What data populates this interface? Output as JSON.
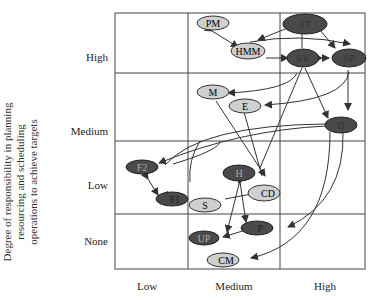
{
  "y_axis": {
    "label_lines": [
      "Degree of responsibility in planning",
      "resourcing and scheduling",
      "operations to achieve targets"
    ],
    "ticks": [
      "High",
      "Medium",
      "Low",
      "None"
    ]
  },
  "x_axis": {
    "ticks": [
      "Low",
      "Medium",
      "High"
    ]
  },
  "nodes": [
    {
      "id": "PM",
      "label": "PM",
      "shade": "light"
    },
    {
      "id": "HMM",
      "label": "HMM",
      "shade": "light"
    },
    {
      "id": "ST",
      "label": "ST",
      "shade": "dark"
    },
    {
      "id": "SV",
      "label": "SV",
      "shade": "dark"
    },
    {
      "id": "SP",
      "label": "SP",
      "shade": "dark"
    },
    {
      "id": "M",
      "label": "M",
      "shade": "light"
    },
    {
      "id": "E",
      "label": "E",
      "shade": "light"
    },
    {
      "id": "D",
      "label": "D",
      "shade": "dark"
    },
    {
      "id": "F2",
      "label": "F2",
      "shade": "dark"
    },
    {
      "id": "F1",
      "label": "F1",
      "shade": "dark"
    },
    {
      "id": "H",
      "label": "H",
      "shade": "dark"
    },
    {
      "id": "CD",
      "label": "CD",
      "shade": "light"
    },
    {
      "id": "S",
      "label": "S",
      "shade": "light"
    },
    {
      "id": "P",
      "label": "P",
      "shade": "dark"
    },
    {
      "id": "UP",
      "label": "UP",
      "shade": "dark"
    },
    {
      "id": "CM",
      "label": "CM",
      "shade": "light"
    }
  ],
  "colors": {
    "light": "#cfcfcf",
    "dark": "#4a4a4a",
    "line": "#333333"
  }
}
